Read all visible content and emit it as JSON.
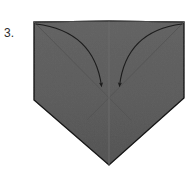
{
  "figure": {
    "kind": "origami-fold-diagram",
    "step_label": "3.",
    "background_color": "#ffffff"
  },
  "colors": {
    "paper_fill": "#9b9b9b",
    "paper_fill_shade": "#949494",
    "paper_outline": "#4a4a4a",
    "crease_line": "#5a5a5a",
    "center_line": "#6a6a6a",
    "arrow_stroke": "#1c1c1c",
    "label_text": "#2b2b2b"
  },
  "shape": {
    "name": "pentagon-house-inverted",
    "description": "Square rotated so that a vertical point hangs below, with a flat top edge and a small V notch at the top center",
    "points": [
      {
        "name": "top-left",
        "x": 34,
        "y": 22
      },
      {
        "name": "top-center-peak",
        "x": 109,
        "y": 21
      },
      {
        "name": "top-right",
        "x": 184,
        "y": 22
      },
      {
        "name": "right-shoulder",
        "x": 184,
        "y": 98
      },
      {
        "name": "bottom-apex",
        "x": 109,
        "y": 165
      },
      {
        "name": "left-shoulder",
        "x": 34,
        "y": 100
      }
    ]
  },
  "creases": [
    {
      "name": "crease-left-diagonal",
      "from": {
        "x": 34,
        "y": 22
      },
      "to": {
        "x": 128,
        "y": 117
      }
    },
    {
      "name": "crease-right-diagonal",
      "from": {
        "x": 184,
        "y": 22
      },
      "to": {
        "x": 90,
        "y": 117
      }
    },
    {
      "name": "crease-center-vertical",
      "from": {
        "x": 109,
        "y": 21
      },
      "to": {
        "x": 109,
        "y": 165
      }
    },
    {
      "name": "crease-top-left-notch",
      "from": {
        "x": 34,
        "y": 22
      },
      "to": {
        "x": 109,
        "y": 21
      }
    },
    {
      "name": "crease-top-right-notch",
      "from": {
        "x": 109,
        "y": 21
      },
      "to": {
        "x": 184,
        "y": 22
      }
    }
  ],
  "arrows": [
    {
      "name": "fold-arrow-left",
      "direction": "top-left-corner-to-center",
      "start": {
        "x": 36,
        "y": 24
      },
      "control": {
        "x": 92,
        "y": 34
      },
      "end": {
        "x": 102,
        "y": 90
      },
      "head_angle_deg": 100
    },
    {
      "name": "fold-arrow-right",
      "direction": "top-right-corner-to-center",
      "start": {
        "x": 182,
        "y": 24
      },
      "control": {
        "x": 128,
        "y": 34
      },
      "end": {
        "x": 119,
        "y": 90
      },
      "head_angle_deg": 80
    }
  ],
  "canvas": {
    "width": 195,
    "height": 170
  }
}
